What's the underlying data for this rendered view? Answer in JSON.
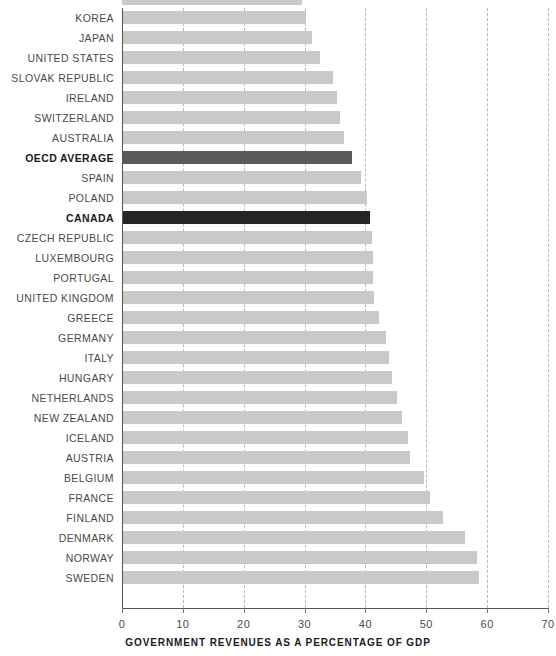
{
  "chart_data": {
    "type": "bar",
    "orientation": "horizontal",
    "title": "",
    "subtitle": "",
    "xlabel": "GOVERNMENT REVENUES AS A PERCENTAGE OF GDP",
    "ylabel": "",
    "xlim": [
      0,
      70
    ],
    "xticks": [
      0,
      10,
      20,
      30,
      40,
      50,
      60,
      70
    ],
    "xtick_labels": [
      "0",
      "10",
      "20",
      "30",
      "40",
      "50",
      "60",
      "70"
    ],
    "grid": "vertical-dashed",
    "legend": "none",
    "categories": [
      "KOREA",
      "JAPAN",
      "UNITED STATES",
      "SLOVAK REPUBLIC",
      "IRELAND",
      "SWITZERLAND",
      "AUSTRALIA",
      "OECD AVERAGE",
      "SPAIN",
      "POLAND",
      "CANADA",
      "CZECH REPUBLIC",
      "LUXEMBOURG",
      "PORTUGAL",
      "UNITED KINGDOM",
      "GREECE",
      "GERMANY",
      "ITALY",
      "HUNGARY",
      "NETHERLANDS",
      "NEW ZEALAND",
      "ICELAND",
      "AUSTRIA",
      "BELGIUM",
      "FRANCE",
      "FINLAND",
      "DENMARK",
      "NORWAY",
      "SWEDEN"
    ],
    "values": [
      30.3,
      31.2,
      32.6,
      34.6,
      35.4,
      35.8,
      36.5,
      37.8,
      39.2,
      40.2,
      40.8,
      41.0,
      41.2,
      41.3,
      41.4,
      42.2,
      43.3,
      43.9,
      44.4,
      45.2,
      46.0,
      47.0,
      47.4,
      49.7,
      50.6,
      52.8,
      56.3,
      58.4,
      58.7
    ],
    "highlighted": {
      "OECD AVERAGE": "mid",
      "CANADA": "dark"
    },
    "colors": {
      "bar_default": "#c9c9c9",
      "bar_highlight_mid": "#5a5a5a",
      "bar_highlight_dark": "#262626",
      "axis": "#555555",
      "gridline": "#b8b8c8",
      "label_text": "#4a4a4a",
      "label_text_bold": "#1a1a1a",
      "background": "#ffffff"
    }
  }
}
